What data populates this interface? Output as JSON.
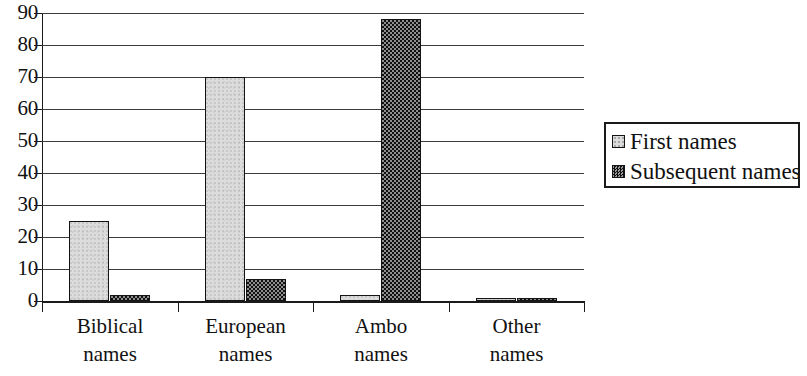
{
  "chart_data": {
    "type": "bar",
    "title": "",
    "subtitle": "",
    "xlabel": "",
    "ylabel": "",
    "categories": [
      "Biblical names",
      "European names",
      "Ambo names",
      "Other names"
    ],
    "category_lines": [
      [
        "Biblical",
        "names"
      ],
      [
        "European",
        "names"
      ],
      [
        "Ambo",
        "names"
      ],
      [
        "Other",
        "names"
      ]
    ],
    "series": [
      {
        "name": "First names",
        "values": [
          25,
          70,
          2,
          0
        ]
      },
      {
        "name": "Subsequent names",
        "values": [
          2,
          7,
          88,
          0
        ]
      }
    ],
    "ylim": [
      0,
      90
    ],
    "y_ticks": [
      0,
      10,
      20,
      30,
      40,
      50,
      60,
      70,
      80,
      90
    ],
    "y_tick_labels": [
      "0",
      "10",
      "20",
      "30",
      "40",
      "50",
      "60",
      "70",
      "80",
      "90"
    ],
    "grid": true,
    "grid_axis": "y",
    "legend_position": "right",
    "legend_entries": [
      "First names",
      "Subsequent names"
    ],
    "colors": {
      "first_names_fill": "#dcdcdc",
      "subsequent_names_fill": "#3a3a3a",
      "bar_border": "#141414",
      "gridline": "#3b3b3b",
      "axis": "#1a1a1a",
      "background": "#ffffff",
      "text": "#111111"
    }
  },
  "axis": {
    "y_labels": [
      "90",
      "80",
      "70",
      "60",
      "50",
      "40",
      "30",
      "20",
      "10",
      "0"
    ]
  },
  "legend": {
    "rows": [
      {
        "label": "First names",
        "swatch": "first-names-swatch"
      },
      {
        "label": "Subsequent names",
        "swatch": "subsequent-names-swatch"
      }
    ]
  }
}
